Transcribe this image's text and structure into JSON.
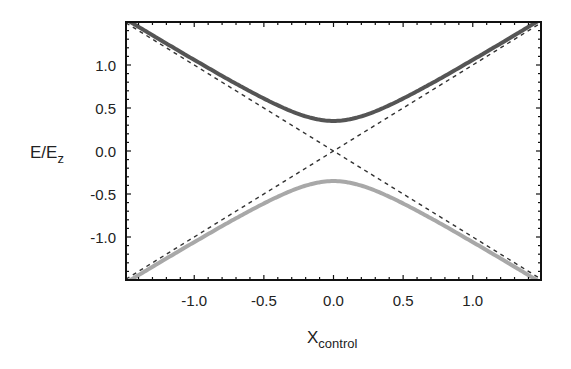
{
  "chart_data": {
    "type": "line",
    "title": "",
    "xlabel": "X",
    "xlabel_subscript": "control",
    "ylabel": "E/E",
    "ylabel_subscript": "z",
    "xlim": [
      -1.49,
      1.49
    ],
    "ylim": [
      -1.5,
      1.5
    ],
    "x_ticks": [
      -1.0,
      -0.5,
      0.0,
      0.5,
      1.0
    ],
    "x_tick_labels": [
      "-1.0",
      "-0.5",
      "0.0",
      "0.5",
      "1.0"
    ],
    "y_ticks": [
      1.0,
      0.5,
      0.0,
      -0.5,
      -1.0
    ],
    "y_tick_labels": [
      "1.0",
      "0.5",
      "0.0",
      "-0.5",
      "-1.0"
    ],
    "grid": false,
    "legend": null,
    "gap_half_width": 0.35,
    "series": [
      {
        "name": "upper branch",
        "style": "solid thick",
        "color": "#555555",
        "formula": "E = +sqrt(x^2 + 0.35^2)",
        "x": [
          -1.49,
          -1.0,
          -0.5,
          -0.25,
          0.0,
          0.25,
          0.5,
          1.0,
          1.49
        ],
        "y": [
          1.53,
          1.06,
          0.61,
          0.43,
          0.35,
          0.43,
          0.61,
          1.06,
          1.53
        ]
      },
      {
        "name": "lower branch",
        "style": "solid thick",
        "color": "#a8a8a8",
        "formula": "E = -sqrt(x^2 + 0.35^2)",
        "x": [
          -1.49,
          -1.0,
          -0.5,
          -0.25,
          0.0,
          0.25,
          0.5,
          1.0,
          1.49
        ],
        "y": [
          -1.53,
          -1.06,
          -0.61,
          -0.43,
          -0.35,
          -0.43,
          -0.61,
          -1.06,
          -1.53
        ]
      },
      {
        "name": "diabatic +",
        "style": "dashed",
        "color": "#333333",
        "formula": "E = x",
        "x": [
          -1.49,
          1.49
        ],
        "y": [
          -1.49,
          1.49
        ]
      },
      {
        "name": "diabatic -",
        "style": "dashed",
        "color": "#333333",
        "formula": "E = -x",
        "x": [
          -1.49,
          1.49
        ],
        "y": [
          1.49,
          -1.49
        ]
      }
    ]
  }
}
